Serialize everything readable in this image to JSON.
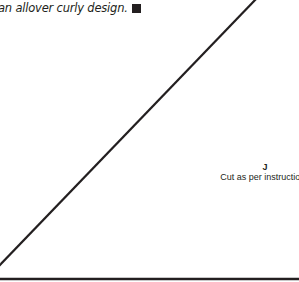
{
  "text": {
    "intro_fragment": "an allover curly design.",
    "end_mark_icon": "black-square"
  },
  "pattern_piece": {
    "letter": "J",
    "instruction": "Cut as per instructions"
  },
  "colors": {
    "ink": "#231f20",
    "background": "#ffffff"
  }
}
